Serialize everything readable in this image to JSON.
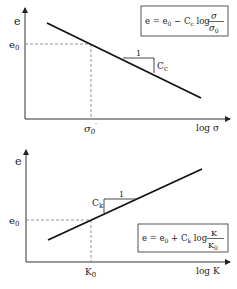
{
  "top_chart": {
    "y_label": "e",
    "y_ref_label": "e",
    "y_ref_sub": "0",
    "x_ref_label": "σ",
    "x_ref_sub": "0",
    "x_ref_prime": "′",
    "x_axis_label": "log σ",
    "slope_run": "1",
    "slope_rise": "C",
    "slope_rise_sub": "c",
    "formula": {
      "lhs": "e = e",
      "lhs_sub": "0",
      "minus": " − C",
      "c_sub": "c",
      "log": " log ",
      "num": "σ",
      "den": "σ",
      "den_sub": "0"
    }
  },
  "bottom_chart": {
    "y_label": "e",
    "y_ref_label": "e",
    "y_ref_sub": "0",
    "x_ref_label": "K",
    "x_ref_sub": "0",
    "x_axis_label": "log K",
    "slope_run": "1",
    "slope_rise": "C",
    "slope_rise_sub": "k",
    "formula": {
      "lhs": "e = e",
      "lhs_sub": "0",
      "plus": " + C",
      "c_sub": "k",
      "log": " log ",
      "num": "K",
      "den": "K",
      "den_sub": "0"
    }
  }
}
